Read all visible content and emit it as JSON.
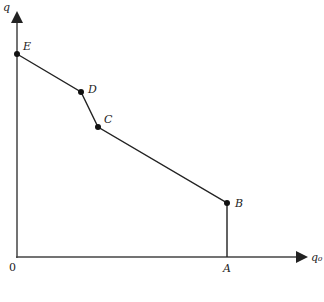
{
  "diagram": {
    "axes": {
      "y_label": "q",
      "x_label": "q₀",
      "origin_label": "0"
    },
    "points": [
      {
        "id": "E",
        "label": "E",
        "x": 17,
        "y": 54
      },
      {
        "id": "D",
        "label": "D",
        "x": 81,
        "y": 92
      },
      {
        "id": "C",
        "label": "C",
        "x": 98,
        "y": 127
      },
      {
        "id": "B",
        "label": "B",
        "x": 227,
        "y": 203
      }
    ],
    "foot_label": "A",
    "colors": {
      "line": "#222222",
      "axis": "#444444"
    }
  }
}
